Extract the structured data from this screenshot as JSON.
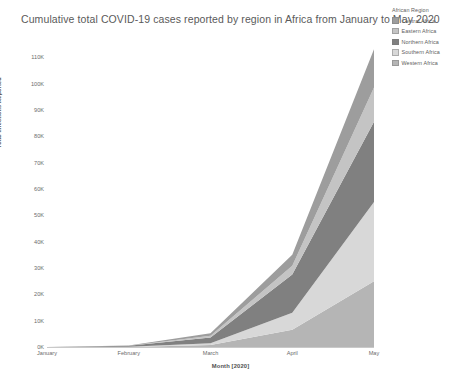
{
  "chart_data": {
    "type": "area",
    "stacked": true,
    "title": "Cumulative total COVID-19 cases reported by region in Africa from January to May 2020",
    "xlabel": "Month [2020]",
    "ylabel": "Total Infections Reported",
    "categories": [
      "January",
      "February",
      "March",
      "April",
      "May"
    ],
    "x": [
      "January",
      "February",
      "March",
      "April",
      "May"
    ],
    "xtick_labels": [
      "January",
      "February",
      "March",
      "April",
      "May"
    ],
    "ytick_labels": [
      "0K",
      "10K",
      "20K",
      "30K",
      "40K",
      "50K",
      "60K",
      "70K",
      "80K",
      "90K",
      "100K",
      "110K"
    ],
    "ytick_values": [
      0,
      10000,
      20000,
      30000,
      40000,
      50000,
      60000,
      70000,
      80000,
      90000,
      100000,
      110000
    ],
    "ylim": [
      0,
      115000
    ],
    "grid": false,
    "legend_position": "right",
    "legend_title": "African Region",
    "stack_order_bottom_to_top": [
      "Western Africa",
      "Southern Africa",
      "Northern Africa",
      "Eastern Africa",
      "Central Africa"
    ],
    "series": [
      {
        "name": "Central Africa",
        "color": "#9d9d9d",
        "values": [
          0,
          100,
          900,
          4200,
          14500
        ]
      },
      {
        "name": "Eastern Africa",
        "color": "#c4c4c4",
        "values": [
          0,
          50,
          700,
          3300,
          13000
        ]
      },
      {
        "name": "Northern Africa",
        "color": "#808080",
        "values": [
          0,
          400,
          2200,
          14500,
          30500
        ]
      },
      {
        "name": "Southern Africa",
        "color": "#d8d8d8",
        "values": [
          0,
          20,
          600,
          6500,
          30000
        ]
      },
      {
        "name": "Western Africa",
        "color": "#b5b5b5",
        "values": [
          0,
          30,
          800,
          6500,
          25000
        ]
      }
    ],
    "totals": [
      0,
      600,
      5200,
      35000,
      113000
    ]
  }
}
